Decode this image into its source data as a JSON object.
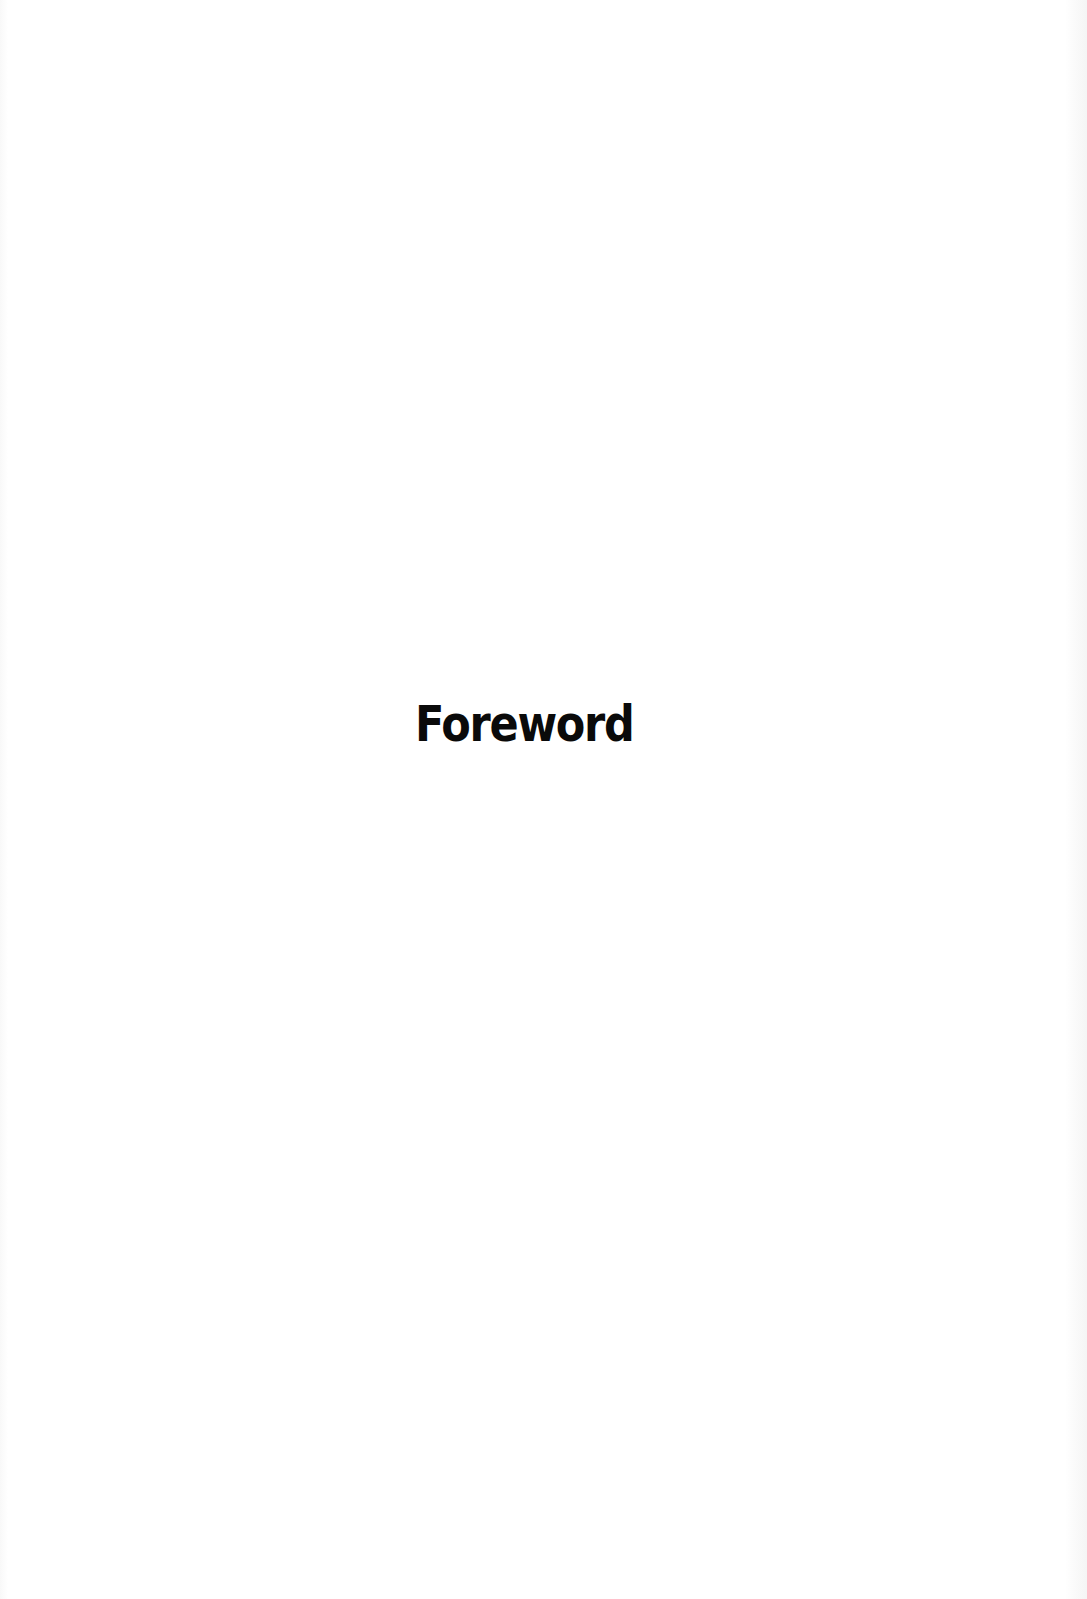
{
  "page": {
    "heading": "Foreword",
    "background_color": "#ffffff",
    "text_color": "#0a0a0a"
  }
}
